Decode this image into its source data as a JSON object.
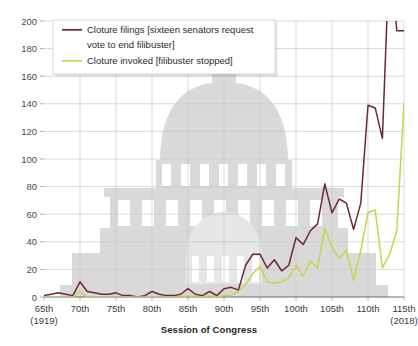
{
  "chart_data": {
    "type": "line",
    "title": "",
    "xlabel": "Session of Congress",
    "ylabel": "",
    "ylim": [
      0,
      200
    ],
    "yticks": [
      0,
      20,
      40,
      60,
      80,
      100,
      120,
      140,
      160,
      180,
      200
    ],
    "xticks": [
      "65th",
      "70th",
      "75th",
      "80th",
      "85th",
      "90th",
      "95th",
      "100th",
      "105th",
      "110th",
      "115th"
    ],
    "x_start_note": "(1919)",
    "x_end_note": "(2018)",
    "grid": true,
    "legend_position": "top-left",
    "categories": [
      65,
      66,
      67,
      68,
      69,
      70,
      71,
      72,
      73,
      74,
      75,
      76,
      77,
      78,
      79,
      80,
      81,
      82,
      83,
      84,
      85,
      86,
      87,
      88,
      89,
      90,
      91,
      92,
      93,
      94,
      95,
      96,
      97,
      98,
      99,
      100,
      101,
      102,
      103,
      104,
      105,
      106,
      107,
      108,
      109,
      110,
      111,
      112,
      113,
      114,
      115
    ],
    "series": [
      {
        "name": "Cloture filings [sixteen senators request vote to end filibuster]",
        "color": "#6b2737",
        "values": [
          1,
          2,
          3,
          2,
          1,
          11,
          4,
          3,
          2,
          2,
          3,
          1,
          1,
          0,
          1,
          4,
          2,
          1,
          1,
          2,
          6,
          2,
          1,
          4,
          1,
          6,
          7,
          5,
          23,
          31,
          31,
          21,
          27,
          19,
          23,
          43,
          38,
          48,
          53,
          82,
          61,
          71,
          68,
          49,
          68,
          139,
          137,
          115,
          253,
          193,
          193
        ]
      },
      {
        "name": "Cloture invoked [filibuster stopped]",
        "color": "#c6d44a",
        "values": [
          0,
          0,
          0,
          0,
          0,
          4,
          0,
          0,
          0,
          0,
          0,
          0,
          0,
          0,
          0,
          0,
          0,
          0,
          0,
          0,
          1,
          0,
          0,
          1,
          0,
          1,
          1,
          4,
          9,
          17,
          22,
          11,
          10,
          11,
          14,
          23,
          15,
          26,
          21,
          50,
          36,
          28,
          34,
          12,
          34,
          61,
          63,
          21,
          31,
          48,
          141
        ]
      }
    ],
    "legend": [
      {
        "label": "Cloture filings [sixteen senators request",
        "label2": "vote to end filibuster]",
        "color": "#6b2737"
      },
      {
        "label": "Cloture invoked [filibuster stopped]",
        "label2": "",
        "color": "#c6d44a"
      }
    ],
    "watermark": "us-capitol-building"
  }
}
